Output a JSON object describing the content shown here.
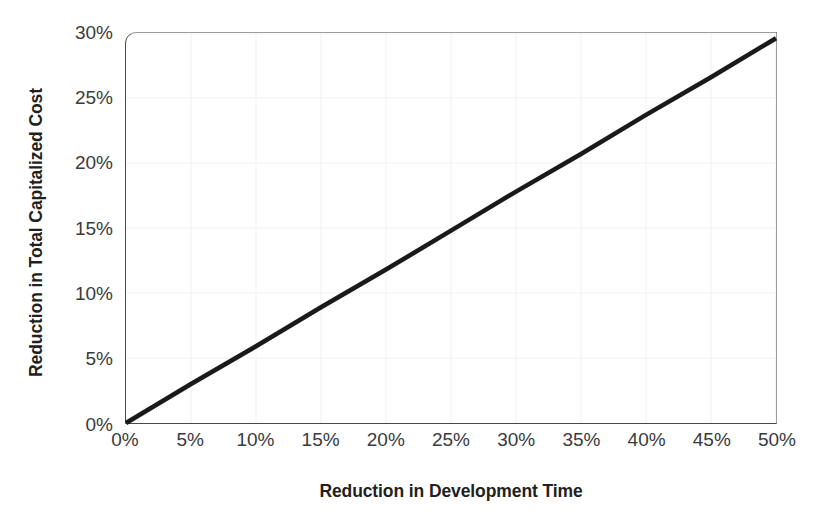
{
  "chart_data": {
    "type": "line",
    "title": "",
    "subtitle": "",
    "xlabel": "Reduction in Development Time",
    "ylabel": "Reduction in Total Capitalized Cost",
    "xlim": [
      0,
      50
    ],
    "ylim": [
      0,
      30
    ],
    "xtick_labels": [
      "0%",
      "5%",
      "10%",
      "15%",
      "20%",
      "25%",
      "30%",
      "35%",
      "40%",
      "45%",
      "50%"
    ],
    "xtick_values": [
      0,
      5,
      10,
      15,
      20,
      25,
      30,
      35,
      40,
      45,
      50
    ],
    "ytick_labels": [
      "0%",
      "5%",
      "10%",
      "15%",
      "20%",
      "25%",
      "30%"
    ],
    "ytick_values": [
      0,
      5,
      10,
      15,
      20,
      25,
      30
    ],
    "grid": true,
    "legend": false,
    "legend_position": "none",
    "annotations": [],
    "series": [
      {
        "name": "Reduction in Total Capitalized Cost",
        "color": "#1a1a1a",
        "x": [
          0,
          5,
          10,
          15,
          20,
          25,
          30,
          35,
          40,
          45,
          50
        ],
        "values": [
          0.0,
          3.0,
          5.9,
          8.9,
          11.8,
          14.8,
          17.8,
          20.7,
          23.7,
          26.6,
          29.6
        ]
      }
    ]
  },
  "axes": {
    "x_title": "Reduction in Development Time",
    "y_title": "Reduction in Total Capitalized Cost"
  },
  "colors": {
    "line": "#1a1a1a",
    "frame": "#4a4a4c",
    "grid": "#f1f1f1",
    "text": "#231f20",
    "tick_text": "#3a3a3c",
    "background": "#ffffff"
  }
}
